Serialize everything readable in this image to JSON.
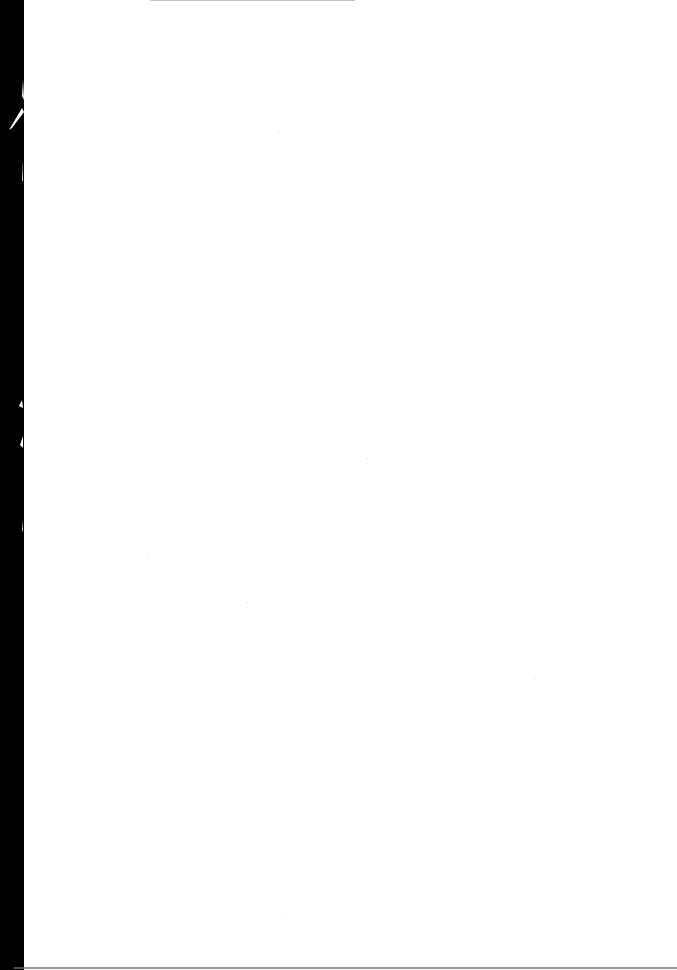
{
  "page": {
    "type": "blank-scanned-page",
    "width": 677,
    "height": 970,
    "background_color": "#ffffff",
    "text_content": ""
  },
  "scan_artifacts": {
    "left_edge_color": "#000000",
    "left_edge_width": 24,
    "top_rule_color": "#9a9a9a",
    "bottom_rule_color": "#6f6f6f"
  }
}
